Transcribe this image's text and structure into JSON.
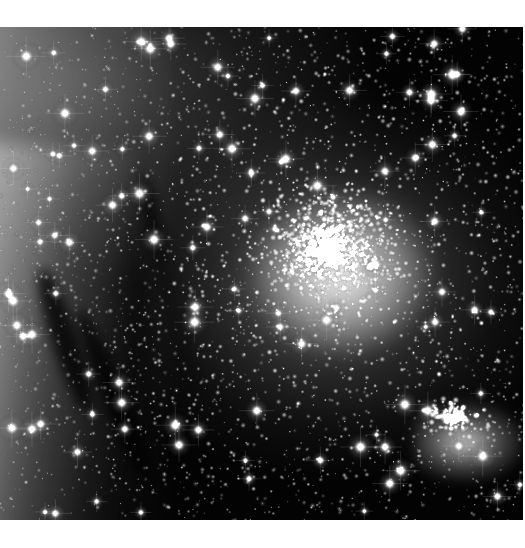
{
  "image": {
    "kind": "astronomical-photograph",
    "subject": "globular star cluster",
    "color_mode": "grayscale",
    "alt_text": "Grayscale astronomical photograph of a dense globular star cluster",
    "caption": "",
    "frame": {
      "canvas_width_px": 525,
      "canvas_height_px": 548,
      "content_left_px": 0,
      "content_top_px": 27,
      "content_width_px": 523,
      "content_height_px": 493,
      "border_color": "#ffffff"
    },
    "palette": {
      "sky_black": "#030303",
      "star_white": "#ffffff",
      "nebula_gray": "#8a8a8a",
      "dust_dark": "#141414",
      "midtone_gray": "#4a4a4a"
    },
    "features": [
      {
        "name": "cluster-core",
        "description": "Dense saturated core where thousands of stars merge into a near-white blaze",
        "center_x_px": 330,
        "center_y_px": 250,
        "radius_px": 95,
        "brightness": "saturated-white"
      },
      {
        "name": "cluster-halo",
        "description": "Resolved halo of individual stars surrounding the core",
        "center_x_px": 335,
        "center_y_px": 255,
        "radius_px": 210,
        "brightness": "bright"
      },
      {
        "name": "left-dust-band",
        "description": "Vertical grey nebulous dust band lit along the left margin",
        "center_x_px": 35,
        "center_y_px": 280,
        "width_px": 120,
        "brightness": "mid-gray"
      },
      {
        "name": "dust-lanes",
        "description": "Dark diagonal dust lanes cutting across the lower-left nebulosity",
        "center_x_px": 110,
        "center_y_px": 400,
        "brightness": "dark"
      },
      {
        "name": "upper-left-haze",
        "description": "Diffuse unresolved haze across the upper-left quadrant",
        "center_x_px": 150,
        "center_y_px": 90,
        "brightness": "low-gray"
      },
      {
        "name": "bright-clump-lower-right",
        "description": "Bright knot of blended stars in the lower-right quadrant",
        "center_x_px": 455,
        "center_y_px": 418,
        "radius_px": 34,
        "brightness": "bright-white"
      },
      {
        "name": "dark-sky-upper-right",
        "description": "Darkest background sky in the upper-right corner",
        "center_x_px": 460,
        "center_y_px": 70,
        "brightness": "black"
      }
    ],
    "star_counts": {
      "core_saturated": 1500,
      "halo_resolved": 2600,
      "field_scattered": 1400,
      "bright_foreground": 120
    }
  }
}
